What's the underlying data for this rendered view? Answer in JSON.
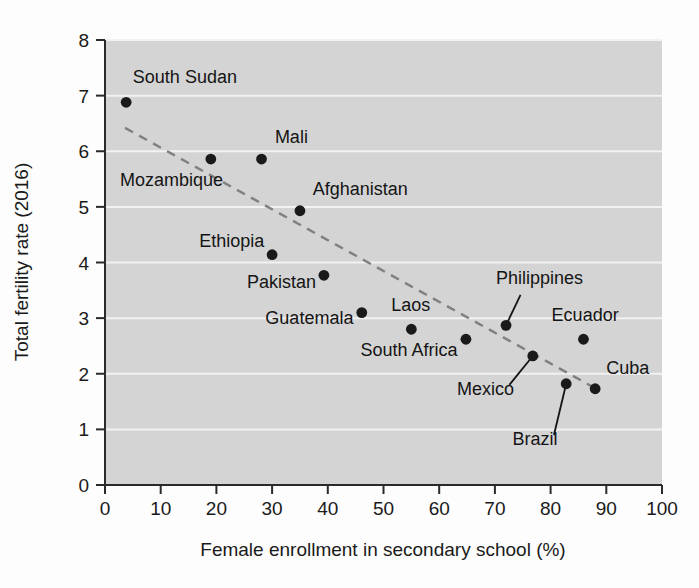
{
  "chart_data": {
    "type": "scatter",
    "title": "",
    "xlabel": "Female enrollment in secondary school (%)",
    "ylabel": "Total fertility rate (2016)",
    "xlim": [
      0,
      100
    ],
    "ylim": [
      0,
      8
    ],
    "xticks": [
      "0",
      "10",
      "20",
      "30",
      "40",
      "50",
      "60",
      "70",
      "80",
      "90",
      "100"
    ],
    "yticks": [
      "0",
      "1",
      "2",
      "3",
      "4",
      "5",
      "6",
      "7",
      "8"
    ],
    "grid": "horizontal-white-gridlines",
    "legend": "none",
    "plot_background": "#d4d4d4",
    "point_color": "#1a1a1a",
    "trendline_color": "#808080",
    "trendline_style": "dashed",
    "trendline": {
      "x_start": 3.6,
      "y_start": 6.42,
      "x_end": 88.0,
      "y_end": 1.74
    },
    "points": [
      {
        "name": "South Sudan",
        "x": 3.8,
        "y": 6.88,
        "label_x": 5.0,
        "label_y": 7.22,
        "label_anchor": "start",
        "leader": false
      },
      {
        "name": "Mozambique",
        "x": 19.0,
        "y": 5.86,
        "label_x": 2.7,
        "label_y": 5.38,
        "label_anchor": "start",
        "leader": false
      },
      {
        "name": "Mali",
        "x": 28.1,
        "y": 5.86,
        "label_x": 30.5,
        "label_y": 6.14,
        "label_anchor": "start",
        "leader": false
      },
      {
        "name": "Afghanistan",
        "x": 35.0,
        "y": 4.93,
        "label_x": 37.3,
        "label_y": 5.22,
        "label_anchor": "start",
        "leader": false
      },
      {
        "name": "Ethiopia",
        "x": 30.0,
        "y": 4.14,
        "label_x": 28.6,
        "label_y": 4.28,
        "label_anchor": "end",
        "leader": false
      },
      {
        "name": "Pakistan",
        "x": 39.3,
        "y": 3.77,
        "label_x": 37.9,
        "label_y": 3.55,
        "label_anchor": "end",
        "leader": false
      },
      {
        "name": "Guatemala",
        "x": 46.1,
        "y": 3.1,
        "label_x": 44.6,
        "label_y": 2.9,
        "label_anchor": "end",
        "leader": false
      },
      {
        "name": "Laos",
        "x": 55.0,
        "y": 2.8,
        "label_x": 54.9,
        "label_y": 3.12,
        "label_anchor": "middle",
        "leader": false
      },
      {
        "name": "South Africa",
        "x": 64.8,
        "y": 2.62,
        "label_x": 63.3,
        "label_y": 2.32,
        "label_anchor": "end",
        "leader": false
      },
      {
        "name": "Philippines",
        "x": 72.0,
        "y": 2.87,
        "label_x": 78.0,
        "label_y": 3.62,
        "label_anchor": "middle",
        "leader": true,
        "leader_x": 74.6,
        "leader_y": 3.42
      },
      {
        "name": "Ecuador",
        "x": 85.9,
        "y": 2.62,
        "label_x": 86.2,
        "label_y": 2.94,
        "label_anchor": "middle",
        "leader": false
      },
      {
        "name": "Mexico",
        "x": 76.8,
        "y": 2.32,
        "label_x": 68.3,
        "label_y": 1.62,
        "label_anchor": "middle",
        "leader": true,
        "leader_x": 72.6,
        "leader_y": 1.8
      },
      {
        "name": "Brazil",
        "x": 82.8,
        "y": 1.82,
        "label_x": 77.2,
        "label_y": 0.72,
        "label_anchor": "middle",
        "leader": true,
        "leader_x": 80.6,
        "leader_y": 0.9
      },
      {
        "name": "Cuba",
        "x": 88.0,
        "y": 1.73,
        "label_x": 90.0,
        "label_y": 2.0,
        "label_anchor": "start",
        "leader": false
      }
    ]
  }
}
